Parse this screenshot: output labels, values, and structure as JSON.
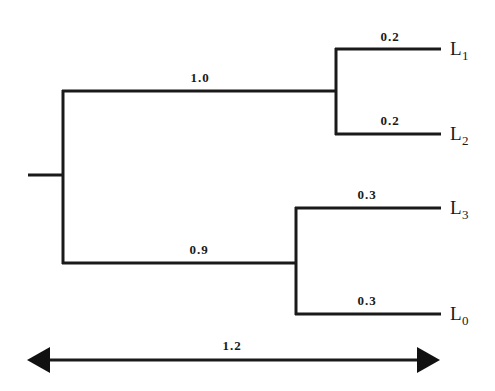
{
  "diagram": {
    "type": "phylogenetic-tree",
    "root": {
      "x": 63,
      "y": 175,
      "stub_start_x": 28
    },
    "internal_nodes": [
      {
        "id": "A",
        "parent": "root",
        "branch_length_label": "1.0",
        "x": 336,
        "y_top": 49,
        "y_bottom": 134,
        "branch_y": 91,
        "label_x": 200,
        "label_y": 82
      },
      {
        "id": "B",
        "parent": "root",
        "branch_length_label": "0.9",
        "x": 296,
        "y_top": 208,
        "y_bottom": 314,
        "branch_y": 263,
        "label_x": 199,
        "label_y": 254
      }
    ],
    "leaves": [
      {
        "id": "L1",
        "name": "L",
        "subscript": "1",
        "parent": "A",
        "branch_length_label": "0.2",
        "y": 49,
        "label_x": 390,
        "label_y": 41
      },
      {
        "id": "L2",
        "name": "L",
        "subscript": "2",
        "parent": "A",
        "branch_length_label": "0.2",
        "y": 134,
        "label_x": 390,
        "label_y": 125
      },
      {
        "id": "L3",
        "name": "L",
        "subscript": "3",
        "parent": "B",
        "branch_length_label": "0.3",
        "y": 208,
        "label_x": 367,
        "label_y": 199
      },
      {
        "id": "L0",
        "name": "L",
        "subscript": "0",
        "parent": "B",
        "branch_length_label": "0.3",
        "y": 314,
        "label_x": 367,
        "label_y": 305
      }
    ],
    "leaf_end_x": 441,
    "scale_bar": {
      "label": "1.2",
      "x_start": 27,
      "x_end": 440,
      "y": 360,
      "label_x": 232,
      "label_y": 350
    }
  }
}
